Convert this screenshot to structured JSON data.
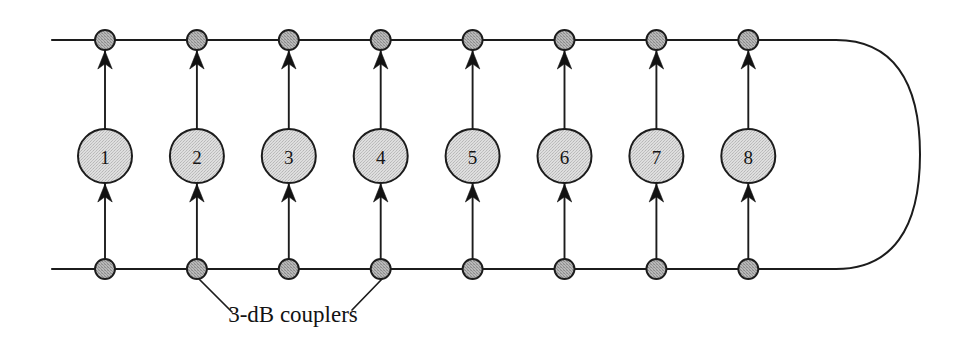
{
  "figure": {
    "canvas": {
      "width": 967,
      "height": 343,
      "background": "#ffffff"
    },
    "colors": {
      "line": "#1c1c1c",
      "amplifier_fill": "#d5d5d5",
      "coupler_fill": "#a8a8a8",
      "text": "#131313"
    }
  },
  "geometry": {
    "top_rail_y": 40,
    "bottom_rail_y": 269,
    "rail_left_x": 52,
    "column_start_x": 105,
    "column_spacing": 91.9,
    "amp_center_y": 156,
    "amp_radius": 27,
    "coupler_radius": 10,
    "loop_right_x": 920,
    "loop_straight_end_x": 836
  },
  "amplifiers": [
    {
      "label": "1",
      "column": 0
    },
    {
      "label": "2",
      "column": 1
    },
    {
      "label": "3",
      "column": 2
    },
    {
      "label": "4",
      "column": 3
    },
    {
      "label": "5",
      "column": 4
    },
    {
      "label": "6",
      "column": 5
    },
    {
      "label": "7",
      "column": 6
    },
    {
      "label": "8",
      "column": 7
    }
  ],
  "top_couplers": [
    {
      "column": 0
    },
    {
      "column": 1
    },
    {
      "column": 2
    },
    {
      "column": 3
    },
    {
      "column": 4
    },
    {
      "column": 5
    },
    {
      "column": 6
    },
    {
      "column": 7
    }
  ],
  "bottom_couplers": [
    {
      "column": 0
    },
    {
      "column": 1
    },
    {
      "column": 2
    },
    {
      "column": 3
    },
    {
      "column": 4
    },
    {
      "column": 5
    },
    {
      "column": 6
    },
    {
      "column": 7
    }
  ],
  "annotation": {
    "text": "3-dB couplers",
    "text_x": 293,
    "text_y": 322,
    "leaders": [
      {
        "from_x": 199,
        "from_y": 279,
        "to_x": 232,
        "to_y": 312
      },
      {
        "from_x": 382,
        "from_y": 279,
        "to_x": 352,
        "to_y": 310
      }
    ]
  }
}
